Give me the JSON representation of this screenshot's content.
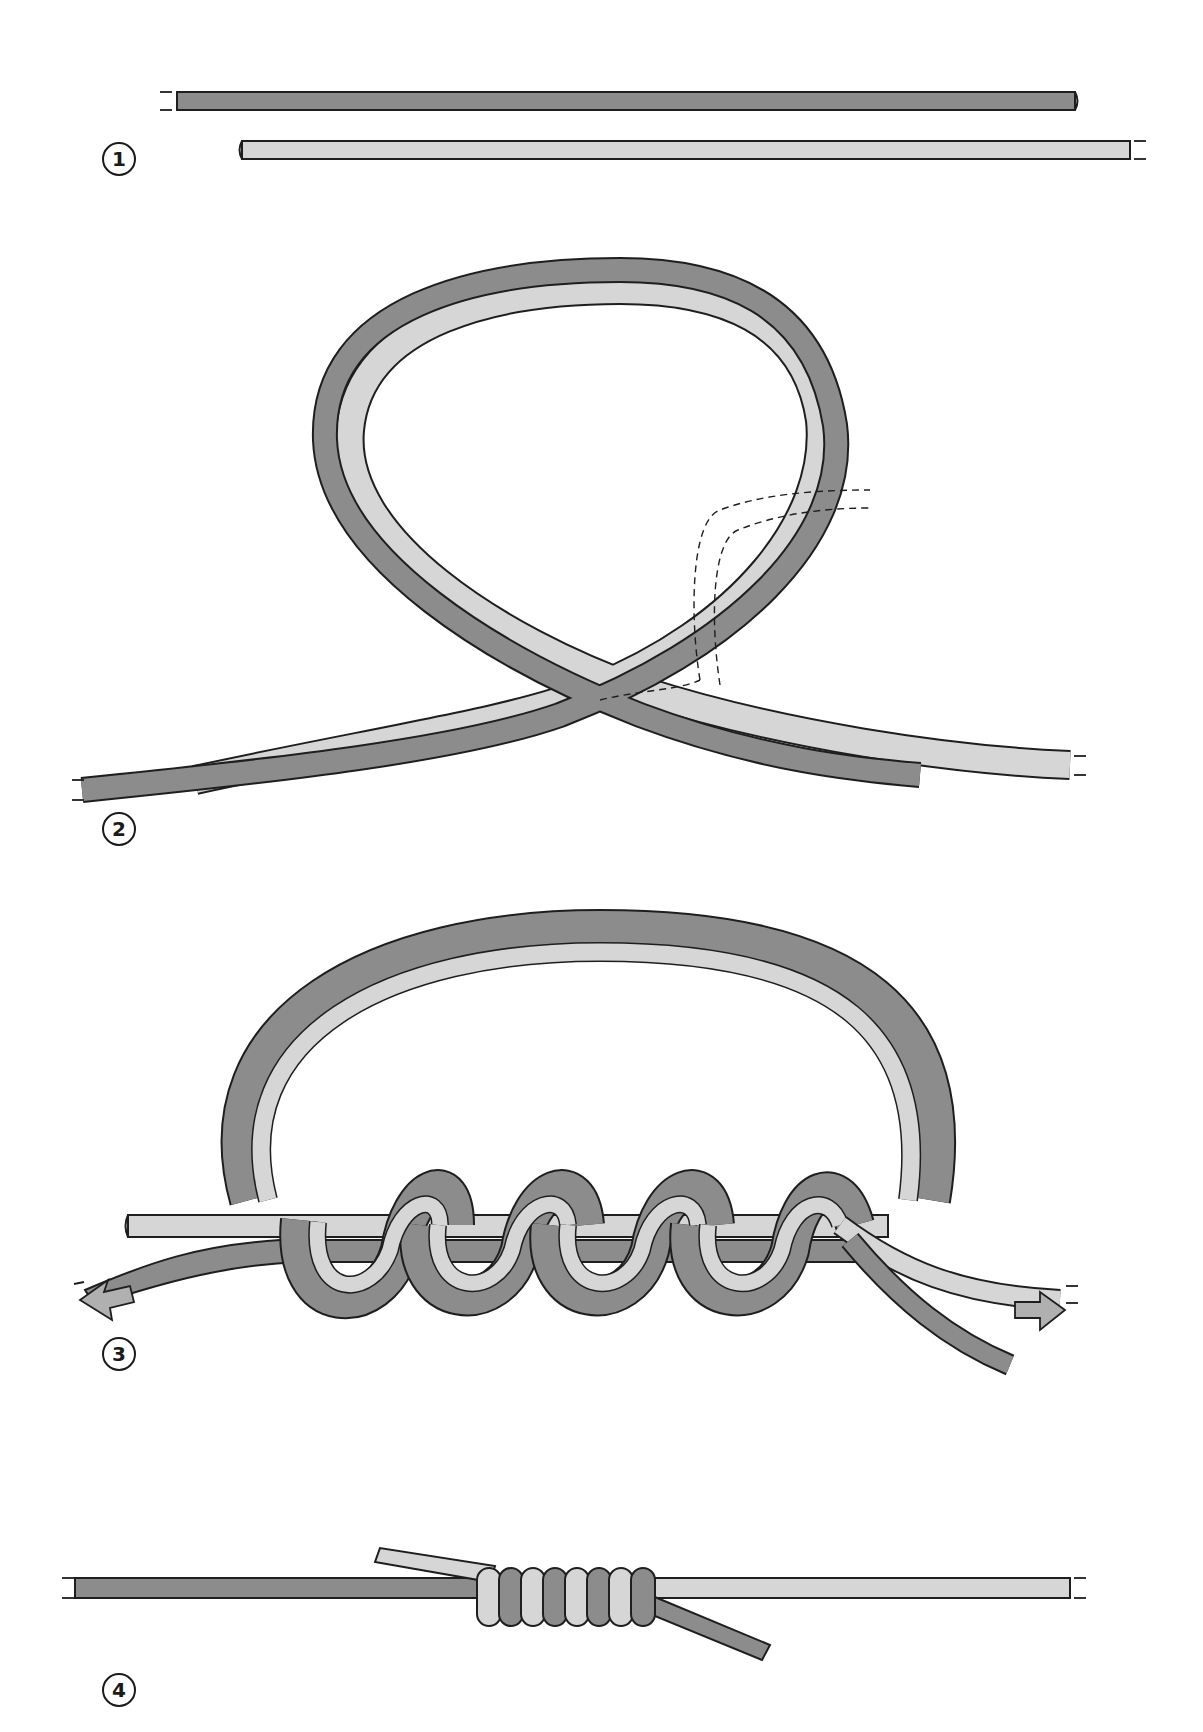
{
  "diagram": {
    "type": "knot-tying-instructions",
    "colors": {
      "rope_dark": "#8c8c8c",
      "rope_light": "#d6d6d6",
      "outline": "#1e1e1e",
      "background": "#ffffff"
    },
    "steps": [
      {
        "number": "1",
        "description": "two parallel rope ends, dark and light, overlapping"
      },
      {
        "number": "2",
        "description": "both ropes formed into a single loop crossing over itself; dashed lines show the path to be taken"
      },
      {
        "number": "3",
        "description": "both ends wrapped four times around the standing parts; arrows show pulling direction"
      },
      {
        "number": "4",
        "description": "finished knot: tight coils of alternating light and dark rope"
      }
    ]
  }
}
